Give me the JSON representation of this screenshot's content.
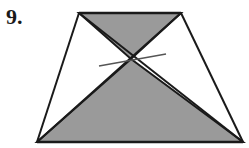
{
  "problem": {
    "number_label": "9."
  },
  "figure": {
    "type": "trapezoid-with-diagonals",
    "vertices": {
      "top_left": [
        79,
        13
      ],
      "top_right": [
        181,
        13
      ],
      "bottom_left": [
        37,
        142
      ],
      "bottom_right": [
        243,
        142
      ]
    },
    "diagonal_intersection": [
      131,
      59
    ],
    "shaded_regions": [
      "top-triangle",
      "bottom-triangle"
    ],
    "shade_color": "#9a9a9a",
    "stroke_color": "#1a1a1a",
    "segment_through_intersection": {
      "from": [
        99,
        66
      ],
      "to": [
        166,
        54
      ],
      "color": "#555555"
    }
  }
}
